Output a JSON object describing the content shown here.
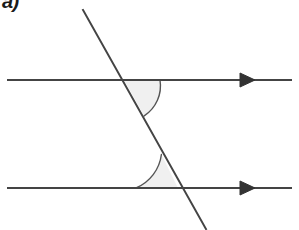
{
  "figure": {
    "part_label": "a)",
    "caption": "Two parallel lines cut by a transversal with two shaded co-interior angles",
    "background_color": "#ffffff",
    "stroke_color": "#444444",
    "arc_fill_color": "#f0f0f0",
    "arc_stroke_color": "#555555",
    "stroke_width": 2,
    "arc_stroke_width": 1.4
  },
  "geometry": {
    "parallel_lines": [
      {
        "name": "upper-parallel-line",
        "x1": 8,
        "y1": 80,
        "x2": 291,
        "y2": 80,
        "direction_marker": "arrowhead-right",
        "marker_x": 240
      },
      {
        "name": "lower-parallel-line",
        "x1": 8,
        "y1": 188,
        "x2": 291,
        "y2": 188,
        "direction_marker": "arrowhead-right",
        "marker_x": 240
      }
    ],
    "transversal": {
      "name": "transversal-line",
      "x1": 83,
      "y1": 10,
      "x2": 206,
      "y2": 229
    },
    "intersections": [
      {
        "name": "upper-intersection",
        "x": 124,
        "y": 80
      },
      {
        "name": "lower-intersection",
        "x": 178,
        "y": 188
      }
    ],
    "angles": [
      {
        "name": "upper-shaded-angle",
        "vertex_x": 124,
        "vertex_y": 80,
        "radius": 36,
        "position": "below-upper-line-right-of-transversal",
        "arc_start_x": 160,
        "arc_start_y": 80,
        "arc_end_x": 144.2,
        "arc_end_y": 115.9
      },
      {
        "name": "lower-shaded-angle",
        "vertex_x": 178,
        "vertex_y": 188,
        "radius": 42,
        "position": "above-lower-line-left-of-transversal",
        "arc_start_x": 136,
        "arc_start_y": 188,
        "arc_end_x": 161.4,
        "arc_end_y": 154.5
      }
    ],
    "arrowhead": {
      "name": "arrowhead",
      "length": 15,
      "half_width": 7
    }
  }
}
